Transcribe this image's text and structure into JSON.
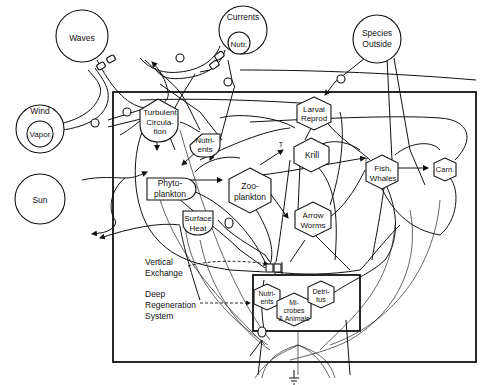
{
  "diagram": {
    "type": "ecosystem energy flow diagram",
    "sources": {
      "waves": "Waves",
      "currents": "Currents",
      "currents_inner": "Nutr.",
      "species_outside": "Species Outside",
      "species_outside_l1": "Species",
      "species_outside_l2": "Outside",
      "wind": "Wind",
      "wind_inner": "Vapor",
      "sun": "Sun"
    },
    "nodes": {
      "turbulent_l1": "Turbulent",
      "turbulent_l2": "Circula-",
      "turbulent_l3": "tion",
      "nutrients_l1": "Nutri-",
      "nutrients_l2": "ents",
      "phyto_l1": "Phyto-",
      "phyto_l2": "plankton",
      "zoo_l1": "Zoo-",
      "zoo_l2": "plankton",
      "larval_l1": "Larval",
      "larval_l2": "Reprod",
      "krill": "Krill",
      "arrow_l1": "Arrow",
      "arrow_l2": "Worms",
      "fish_l1": "Fish,",
      "fish_l2": "Whales",
      "carn": "Carn.",
      "surface_l1": "Surface",
      "surface_l2": "Heat",
      "deep_nutr_l1": "Nutri-",
      "deep_nutr_l2": "ents",
      "microbes_l1": "Mi-",
      "microbes_l2": "crobes",
      "microbes_l3": "& Animals",
      "detritus_l1": "Detri-",
      "detritus_l2": "tus"
    },
    "annotations": {
      "vertical_l1": "Vertical",
      "vertical_l2": "Exchange",
      "deep_l1": "Deep",
      "deep_l2": "Regeneration",
      "deep_l3": "System",
      "switch_t": "T"
    }
  }
}
